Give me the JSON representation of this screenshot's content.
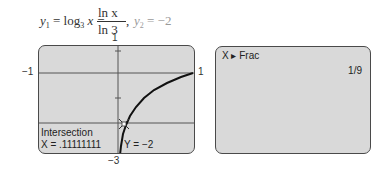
{
  "formula": {
    "y1_lhs": "y",
    "y1_sub": "1",
    "eq1": " = log",
    "log_base": "3",
    "log_arg": " x =",
    "frac_num": "ln x",
    "frac_den": "ln 3",
    "comma": ",",
    "y2_lhs": "y",
    "y2_sub": "2",
    "y2_rhs": " = −2"
  },
  "graph_window": {
    "xmin_label": "−1",
    "xmax_label": "1",
    "ymax_label": "1",
    "ymin_label": "−3",
    "xmin": -1,
    "xmax": 1,
    "ymin": -3,
    "ymax": 1,
    "intersection_title": "Intersection",
    "x_readout": "X = .11111111",
    "y_readout": "Y = −2"
  },
  "home_screen": {
    "command": "X ▸ Frac",
    "result": "1/9"
  },
  "colors": {
    "screen_bg": "#d9d9d9",
    "screen_border": "#4a4a4a",
    "curve": "#111111",
    "line": "#555555"
  }
}
